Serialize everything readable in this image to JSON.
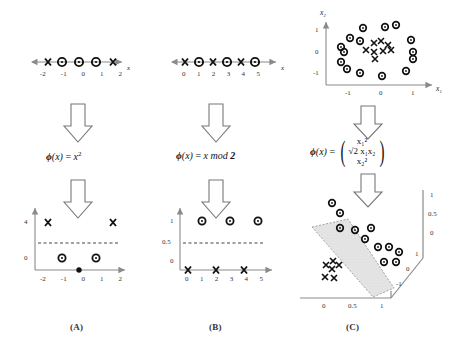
{
  "figure": {
    "panels": [
      {
        "id": "A",
        "caption": "(A)"
      },
      {
        "id": "B",
        "caption": "(B)"
      },
      {
        "id": "C",
        "caption": "(C)"
      }
    ],
    "arrow_icon": "down-block-arrow"
  },
  "colors": {
    "axis": "#8a8a8a",
    "marker": "#111111",
    "dashed": "#444444",
    "slab_fill": "#e2e2e2",
    "slab_stroke": "#9a9a9a",
    "text": "#1a1a1a"
  },
  "panelA": {
    "caption": "(A)",
    "formula_html": "ϕ(x) = x²",
    "formula_plain": "phi(x) = x^2",
    "input": {
      "axis_label": "x",
      "ticks": [
        "-2",
        "-1",
        "0",
        "1",
        "2"
      ],
      "points": [
        {
          "x": -2,
          "class": "X"
        },
        {
          "x": -1,
          "class": "O"
        },
        {
          "x": 0,
          "class": "O"
        },
        {
          "x": 1,
          "class": "O"
        },
        {
          "x": 2,
          "class": "X"
        }
      ]
    },
    "output": {
      "xticks": [
        "-2",
        "-1",
        "0",
        "1",
        "2"
      ],
      "yticks": [
        "0",
        "4"
      ],
      "threshold": 2,
      "points": [
        {
          "x": -2,
          "y": 4,
          "class": "X"
        },
        {
          "x": -1,
          "y": 1,
          "class": "O"
        },
        {
          "x": 0,
          "y": 0,
          "class": "O"
        },
        {
          "x": 1,
          "y": 1,
          "class": "O"
        },
        {
          "x": 2,
          "y": 4,
          "class": "X"
        }
      ]
    }
  },
  "panelB": {
    "caption": "(B)",
    "formula_html": "ϕ(x) = x mod 2",
    "formula_plain": "phi(x) = x mod 2",
    "input": {
      "axis_label": "x",
      "ticks": [
        "0",
        "1",
        "2",
        "3",
        "4",
        "5"
      ],
      "points": [
        {
          "x": 0,
          "class": "X"
        },
        {
          "x": 1,
          "class": "O"
        },
        {
          "x": 2,
          "class": "X"
        },
        {
          "x": 3,
          "class": "O"
        },
        {
          "x": 4,
          "class": "X"
        },
        {
          "x": 5,
          "class": "O"
        }
      ]
    },
    "output": {
      "xticks": [
        "0",
        "1",
        "2",
        "3",
        "4",
        "5"
      ],
      "yticks": [
        "0",
        "0.5",
        "1"
      ],
      "threshold": 0.5,
      "points": [
        {
          "x": 0,
          "y": 0,
          "class": "X"
        },
        {
          "x": 1,
          "y": 1,
          "class": "O"
        },
        {
          "x": 2,
          "y": 0,
          "class": "X"
        },
        {
          "x": 3,
          "y": 1,
          "class": "O"
        },
        {
          "x": 4,
          "y": 0,
          "class": "X"
        },
        {
          "x": 5,
          "y": 1,
          "class": "O"
        }
      ]
    }
  },
  "panelC": {
    "caption": "(C)",
    "formula_lead": "ϕ(x) =",
    "formula_rows": [
      "x₁²",
      "√2 x₁x₂",
      "x₂²"
    ],
    "formula_plain": "phi(x) = (x1^2, sqrt(2) x1 x2, x2^2)",
    "input": {
      "xaxis_label": "x₁",
      "yaxis_label": "x₂",
      "xticks": [
        "-1",
        "0",
        "1"
      ],
      "yticks": [
        "-1",
        "0",
        "1"
      ],
      "circles": [
        {
          "x": -0.45,
          "y": 1.05
        },
        {
          "x": 0.12,
          "y": 1.08
        },
        {
          "x": 0.38,
          "y": 1.12
        },
        {
          "x": -0.78,
          "y": 0.72
        },
        {
          "x": -0.52,
          "y": 0.62
        },
        {
          "x": 0.82,
          "y": 0.62
        },
        {
          "x": -1.02,
          "y": 0.18
        },
        {
          "x": -0.88,
          "y": 0.05
        },
        {
          "x": 1.0,
          "y": 0.08
        },
        {
          "x": 1.02,
          "y": -0.12
        },
        {
          "x": -1.0,
          "y": -0.45
        },
        {
          "x": -0.82,
          "y": -0.62
        },
        {
          "x": -0.5,
          "y": -0.85
        },
        {
          "x": 0.05,
          "y": -1.02
        },
        {
          "x": 0.78,
          "y": -0.78
        }
      ],
      "crosses": [
        {
          "x": -0.18,
          "y": 0.42
        },
        {
          "x": -0.02,
          "y": 0.35
        },
        {
          "x": 0.14,
          "y": 0.28
        },
        {
          "x": -0.42,
          "y": 0.08
        },
        {
          "x": -0.22,
          "y": 0.02
        },
        {
          "x": 0.05,
          "y": 0.0
        },
        {
          "x": 0.24,
          "y": 0.06
        },
        {
          "x": -0.08,
          "y": -0.22
        }
      ]
    },
    "output": {
      "xticks": [
        "0",
        "0.5",
        "1"
      ],
      "vticks": [
        "0",
        "0.5",
        "1"
      ],
      "dticks": [
        "-1",
        "0",
        "1"
      ],
      "circles": [
        {
          "px": 84,
          "py": 205
        },
        {
          "px": 96,
          "py": 216
        },
        {
          "px": 104,
          "py": 232
        },
        {
          "px": 122,
          "py": 233
        },
        {
          "px": 145,
          "py": 230
        },
        {
          "px": 134,
          "py": 242
        },
        {
          "px": 158,
          "py": 241
        },
        {
          "px": 146,
          "py": 254
        },
        {
          "px": 163,
          "py": 254
        },
        {
          "px": 150,
          "py": 265
        },
        {
          "px": 166,
          "py": 265
        },
        {
          "px": 176,
          "py": 252
        },
        {
          "px": 184,
          "py": 262
        },
        {
          "px": 112,
          "py": 224
        },
        {
          "px": 128,
          "py": 248
        }
      ],
      "crosses": [
        {
          "px": 68,
          "py": 262
        },
        {
          "px": 76,
          "py": 258
        },
        {
          "px": 84,
          "py": 263
        },
        {
          "px": 72,
          "py": 270
        },
        {
          "px": 66,
          "py": 276
        },
        {
          "px": 76,
          "py": 277
        },
        {
          "px": 86,
          "py": 270
        },
        {
          "px": 80,
          "py": 267
        }
      ],
      "separator": "slab"
    }
  }
}
